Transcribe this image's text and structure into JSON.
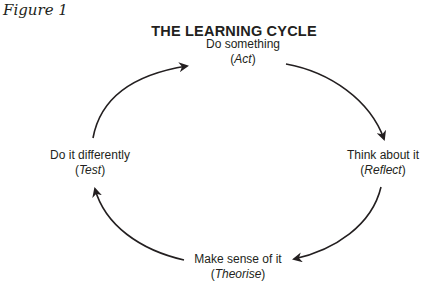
{
  "figure_label": "Figure 1",
  "title": "THE LEARNING CYCLE",
  "nodes": [
    {
      "id": "act",
      "label": "Do something",
      "stage": "Act"
    },
    {
      "id": "reflect",
      "label": "Think about it",
      "stage": "Reflect"
    },
    {
      "id": "theorise",
      "label": "Make sense of it",
      "stage": "Theorise"
    },
    {
      "id": "test",
      "label": "Do it differently",
      "stage": "Test"
    }
  ],
  "edges": [
    {
      "from": "act",
      "to": "reflect"
    },
    {
      "from": "reflect",
      "to": "theorise"
    },
    {
      "from": "theorise",
      "to": "test"
    },
    {
      "from": "test",
      "to": "act"
    }
  ],
  "colors": {
    "text": "#231f20",
    "arrow": "#231f20",
    "background": "#ffffff"
  }
}
